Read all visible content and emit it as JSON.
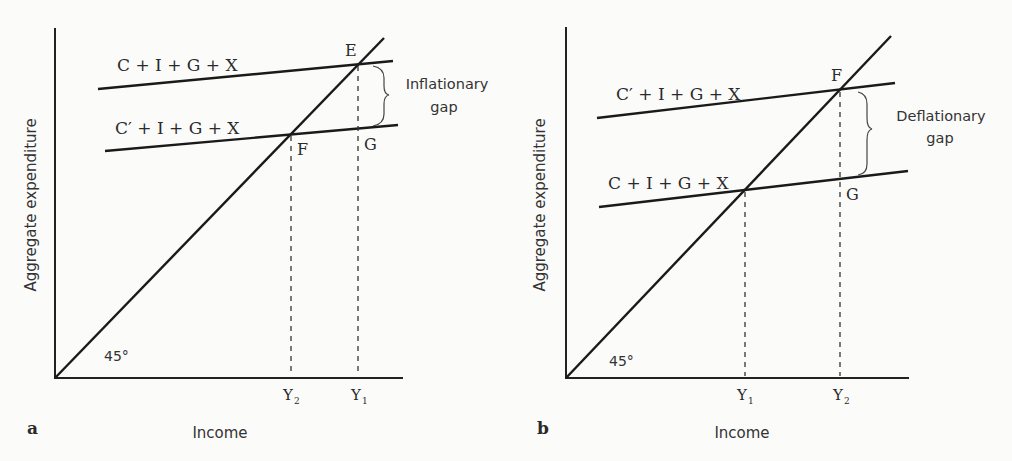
{
  "figure": {
    "panels": [
      {
        "id": "a",
        "panel_letter": "a",
        "xlabel": "Income",
        "ylabel": "Aggregate expenditure",
        "angle_label": "45°",
        "upper_line_label": "C + I + G + X",
        "lower_line_label": "C′ + I + G + X",
        "point_upper": "E",
        "point_lower": "F",
        "point_gap": "G",
        "gap_label_line1": "Inflationary",
        "gap_label_line2": "gap",
        "x_tick_left": "Y",
        "x_tick_left_sub": "2",
        "x_tick_right": "Y",
        "x_tick_right_sub": "1"
      },
      {
        "id": "b",
        "panel_letter": "b",
        "xlabel": "Income",
        "ylabel": "Aggregate expenditure",
        "angle_label": "45°",
        "upper_line_label": "C′ + I + G + X",
        "lower_line_label": "C + I + G + X",
        "point_upper": "F",
        "point_gap": "G",
        "gap_label_line1": "Deflationary",
        "gap_label_line2": "gap",
        "x_tick_left": "Y",
        "x_tick_left_sub": "1",
        "x_tick_right": "Y",
        "x_tick_right_sub": "2"
      }
    ]
  }
}
